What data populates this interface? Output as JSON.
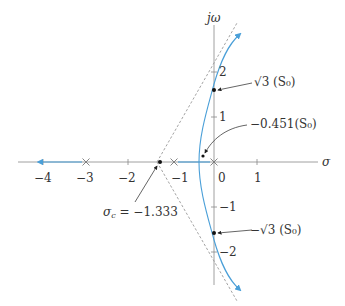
{
  "diagram": {
    "type": "root-locus",
    "axes": {
      "x_label": "σ",
      "y_label": "jω",
      "x_ticks": [
        "−4",
        "−3",
        "−2",
        "−1",
        "0",
        "1"
      ],
      "y_ticks": [
        "2",
        "1",
        "−1",
        "−2"
      ]
    },
    "poles": [
      -3,
      -1,
      0
    ],
    "zeros": [],
    "asymptote_centroid": {
      "value": -1.333,
      "label": "σc = −1.333",
      "sigma_symbol": "σ",
      "sub": "c",
      "rest": " = −1.333"
    },
    "annotations": {
      "jw_crossing_upper": "√3 (S₀)",
      "breakaway": "−0.451(S₀)",
      "jw_crossing_lower": "−√3 (S₀)"
    },
    "colors": {
      "locus": "#4a9fd8",
      "axis": "#888888",
      "asymptote": "#999999",
      "text": "#333333",
      "point": "#111111"
    }
  }
}
